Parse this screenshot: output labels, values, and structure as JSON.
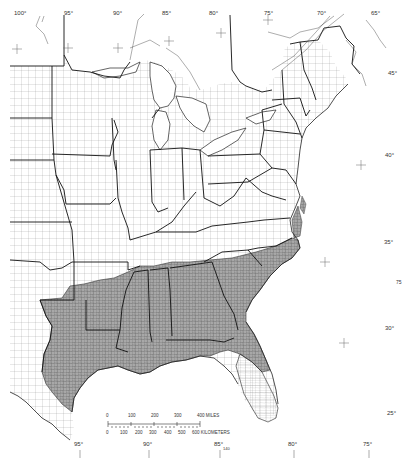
{
  "map": {
    "title": "Eastern United States county map",
    "colors": {
      "background": "#ffffff",
      "shaded_region": "#a9a9a9",
      "county_lines": "#555555",
      "state_lines": "#111111",
      "coast": "#222222"
    },
    "shaded_region_label": "Southeastern states (shaded)",
    "top_longitude_labels": [
      {
        "text": "100°",
        "x": 14,
        "y": 14
      },
      {
        "text": "95°",
        "x": 64,
        "y": 14
      },
      {
        "text": "90°",
        "x": 113,
        "y": 14
      },
      {
        "text": "85°",
        "x": 162,
        "y": 14
      },
      {
        "text": "80°",
        "x": 209,
        "y": 14
      },
      {
        "text": "75°",
        "x": 264,
        "y": 14
      },
      {
        "text": "70°",
        "x": 317,
        "y": 14
      },
      {
        "text": "65°",
        "x": 371,
        "y": 14
      }
    ],
    "right_latitude_labels": [
      {
        "text": "45°",
        "x": 388,
        "y": 73
      },
      {
        "text": "40°",
        "x": 385,
        "y": 155
      },
      {
        "text": "35°",
        "x": 384,
        "y": 242
      },
      {
        "text": "30°",
        "x": 385,
        "y": 328
      },
      {
        "text": "25°",
        "x": 387,
        "y": 413
      }
    ],
    "bottom_longitude_labels": [
      {
        "text": "95°",
        "x": 76,
        "y": 443
      },
      {
        "text": "90°",
        "x": 145,
        "y": 443
      },
      {
        "text": "85°",
        "x": 216,
        "y": 443
      },
      {
        "text": "80°",
        "x": 290,
        "y": 443
      },
      {
        "text": "75°",
        "x": 365,
        "y": 443
      }
    ],
    "misc_labels": [
      {
        "text": "75",
        "x": 396,
        "y": 282
      },
      {
        "text": "140",
        "x": 223,
        "y": 447
      }
    ],
    "scale_bar": {
      "miles_ticks": [
        "0",
        "100",
        "200",
        "300",
        "400 MILES"
      ],
      "km_ticks": [
        "0",
        "100",
        "200",
        "300",
        "400",
        "500",
        "600 KILOMETERS"
      ]
    }
  }
}
